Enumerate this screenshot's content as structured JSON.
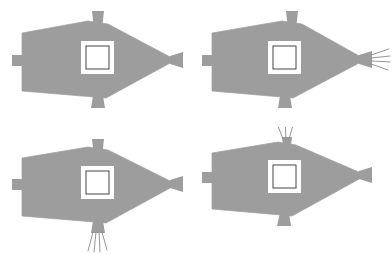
{
  "figure": {
    "title": "",
    "type": "diagram-grid",
    "background_color": "#ffffff",
    "body_fill_color": "#9d9d9d",
    "body_stroke_color": "#9d9d9d",
    "window_fill_color": "#ffffff",
    "window_stroke_color": "#444444",
    "bristle_color": "#8a8a8a",
    "rows": 2,
    "columns": 4,
    "panel_width": 196,
    "panel_height": 127
  },
  "panels": [
    {
      "id": "panel-top-left",
      "position": "top-left",
      "label": "",
      "body_shape": "kite-polygon",
      "window": {
        "shape": "square",
        "label": ""
      },
      "tabs": [
        {
          "name": "left-tab",
          "shape": "rectangle",
          "bristles": 0
        },
        {
          "name": "top-tab",
          "shape": "trapezoid",
          "bristles": 0
        },
        {
          "name": "bottom-tab",
          "shape": "trapezoid",
          "bristles": 0
        },
        {
          "name": "right-tab",
          "shape": "trapezoid",
          "bristles": 0
        }
      ],
      "bristle_tab": "none"
    },
    {
      "id": "panel-top-right",
      "position": "top-right",
      "label": "",
      "body_shape": "kite-polygon",
      "window": {
        "shape": "square",
        "label": ""
      },
      "tabs": [
        {
          "name": "left-tab",
          "shape": "rectangle",
          "bristles": 0
        },
        {
          "name": "top-tab",
          "shape": "trapezoid",
          "bristles": 0
        },
        {
          "name": "bottom-tab",
          "shape": "trapezoid",
          "bristles": 0
        },
        {
          "name": "right-tab",
          "shape": "trapezoid",
          "bristles": 4
        }
      ],
      "bristle_tab": "right-tab"
    },
    {
      "id": "panel-bottom-left",
      "position": "bottom-left",
      "label": "",
      "body_shape": "kite-polygon",
      "window": {
        "shape": "square",
        "label": ""
      },
      "tabs": [
        {
          "name": "left-tab",
          "shape": "rectangle",
          "bristles": 0
        },
        {
          "name": "top-tab",
          "shape": "trapezoid",
          "bristles": 0
        },
        {
          "name": "bottom-tab",
          "shape": "trapezoid",
          "bristles": 4
        },
        {
          "name": "right-tab",
          "shape": "trapezoid",
          "bristles": 0
        }
      ],
      "bristle_tab": "bottom-tab"
    },
    {
      "id": "panel-bottom-right",
      "position": "bottom-right",
      "label": "",
      "body_shape": "kite-polygon",
      "window": {
        "shape": "square",
        "label": ""
      },
      "tabs": [
        {
          "name": "left-tab",
          "shape": "rectangle",
          "bristles": 0
        },
        {
          "name": "top-tab",
          "shape": "trapezoid",
          "bristles": 3
        },
        {
          "name": "bottom-tab",
          "shape": "trapezoid",
          "bristles": 0
        },
        {
          "name": "right-tab",
          "shape": "trapezoid",
          "bristles": 0
        }
      ],
      "bristle_tab": "top-tab"
    }
  ]
}
